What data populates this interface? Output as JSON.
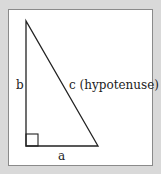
{
  "diagram": {
    "type": "right-triangle",
    "labels": {
      "side_a": "a",
      "side_b": "b",
      "side_c": "c (hypotenuse)"
    },
    "colors": {
      "background": "#d9d9d9",
      "panel": "#ffffff",
      "stroke": "#222222"
    }
  }
}
